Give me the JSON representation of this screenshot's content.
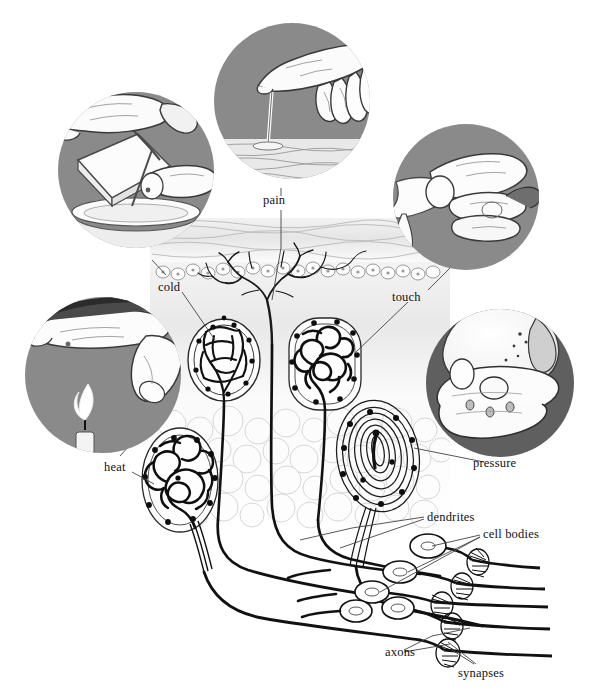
{
  "figure": {
    "background_color": "#ffffff",
    "inset_circle_color": "#8a8a8a",
    "inset_circle_dark_color": "#5f5f5f",
    "line_color": "#333333",
    "ink_color": "#111111"
  },
  "labels": {
    "pain": "pain",
    "cold": "cold",
    "touch": "touch",
    "heat": "heat",
    "pressure": "pressure",
    "dendrites": "dendrites",
    "cell_bodies": "cell bodies",
    "axons": "axons",
    "synapses": "synapses"
  },
  "insets": [
    {
      "id": "pain",
      "label": "pain",
      "scene": "fingertip pressing a sharp pin/tack into skin surface",
      "ring_shade": "#8a8a8a",
      "cx": 292,
      "cy": 101,
      "r": 78
    },
    {
      "id": "cold",
      "label": "cold",
      "scene": "hand holding ice block with tongs over a dish of water",
      "ring_shade": "#8a8a8a",
      "cx": 136,
      "cy": 170,
      "r": 78
    },
    {
      "id": "touch",
      "label": "touch",
      "scene": "fingers rubbing a piece of cloth / feather between fingertips",
      "ring_shade": "#8a8a8a",
      "cx": 466,
      "cy": 197,
      "r": 73
    },
    {
      "id": "heat",
      "label": "heat",
      "scene": "fingertip held above a candle flame",
      "ring_shade": "#8a8a8a",
      "cx": 103,
      "cy": 375,
      "r": 78
    },
    {
      "id": "pressure",
      "label": "pressure",
      "scene": "open palm holding a heavy rock",
      "ring_shade": "#5f5f5f",
      "cx": 500,
      "cy": 383,
      "r": 74
    }
  ],
  "receptors": [
    {
      "id": "free-nerve-endings",
      "label_ref": "pain",
      "description": "free nerve endings branching into epidermis"
    },
    {
      "id": "krause-end-bulb",
      "label_ref": "cold",
      "description": "end bulb of Krause - cold receptor"
    },
    {
      "id": "ruffini-ending",
      "label_ref": "touch",
      "description": "coiled Ruffini / Meissner corpuscle - touch receptor"
    },
    {
      "id": "ruffini-heat",
      "label_ref": "heat",
      "description": "coiled organ of Ruffini - heat receptor"
    },
    {
      "id": "pacinian-corpuscle",
      "label_ref": "pressure",
      "description": "lamellated Pacinian corpuscle - pressure receptor"
    }
  ],
  "neurons": {
    "count": 5,
    "parts": [
      "dendrites",
      "cell bodies",
      "axons",
      "synapses"
    ]
  },
  "skin_layers": [
    "epidermis",
    "dermis",
    "subcutaneous fat"
  ]
}
